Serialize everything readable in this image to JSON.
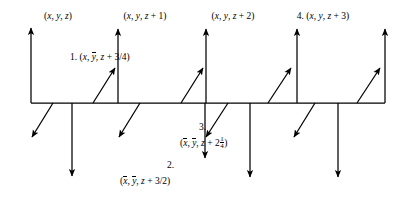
{
  "diagram": {
    "type": "symmetry-operator-diagram",
    "stroke_color": "#000000",
    "background_color": "#ffffff",
    "baseline_y": 103,
    "baseline_x_start": 31,
    "baseline_x_end": 385,
    "period_px": 88,
    "top_labels": [
      {
        "id": "pos-0",
        "prefix": "",
        "coords": "(x, y, z)",
        "x": 35,
        "parts": [
          "(",
          "x",
          ", ",
          "y",
          ", ",
          "z",
          ")"
        ]
      },
      {
        "id": "pos-1",
        "prefix": "",
        "coords": "(x, y, z + 1)",
        "x": 122,
        "parts": [
          "(",
          "x",
          ", ",
          "y",
          ", ",
          "z",
          " + 1)"
        ]
      },
      {
        "id": "pos-2",
        "prefix": "",
        "coords": "(x, y, z + 2)",
        "x": 210,
        "parts": [
          "(",
          "x",
          ", ",
          "y",
          ", ",
          "z",
          " + 2)"
        ]
      },
      {
        "id": "pos-3",
        "prefix": "4.",
        "coords": "(x, y, z + 3)",
        "x": 300,
        "parts": [
          "(",
          "x",
          ", ",
          "y",
          ", ",
          "z",
          " + 3)"
        ]
      }
    ],
    "op_labels": [
      {
        "id": "op-1",
        "number": "1.",
        "open": "(",
        "x_sym": "x",
        "sep1": ", ",
        "y_sym": "y",
        "y_bar": true,
        "sep2": ", ",
        "z_sym": "z",
        "plus": " + ",
        "fraction_num": "3",
        "fraction_den": "4",
        "close": ")",
        "text": "1. (x, ȳ, z + 3/4)"
      },
      {
        "id": "op-2",
        "number": "2.",
        "open": "(",
        "x_sym": "x",
        "x_bar": true,
        "sep1": ", ",
        "y_sym": "y",
        "y_bar": true,
        "sep2": ", ",
        "z_sym": "z",
        "plus": " + ",
        "fraction_num": "3",
        "fraction_den": "2",
        "close": ")",
        "text": "2. (x̄, ȳ, z + 3/2)"
      },
      {
        "id": "op-3",
        "number": "3.",
        "open": "(",
        "x_sym": "x",
        "x_bar": true,
        "sep1": ", ",
        "y_sym": "y",
        "y_bar": true,
        "sep2": ", ",
        "z_sym": "z",
        "plus": " + ",
        "whole": "2",
        "fraction_num": "1",
        "fraction_den": "4",
        "close": ")",
        "text": "3. (x̄, ȳ, z + 2¼)"
      },
      {
        "id": "op-4",
        "number": "4.",
        "text": "4. (x, y, z + 3)"
      }
    ],
    "arrows": {
      "up_vertical": [
        {
          "x": 31,
          "y0": 103,
          "y1": 28
        },
        {
          "x": 118,
          "y0": 103,
          "y1": 29
        },
        {
          "x": 206,
          "y0": 103,
          "y1": 29
        },
        {
          "x": 297,
          "y0": 103,
          "y1": 29
        },
        {
          "x": 385,
          "y0": 103,
          "y1": 29
        }
      ],
      "down_vertical": [
        {
          "x": 72,
          "y0": 103,
          "y1": 176
        },
        {
          "x": 205,
          "y0": 103,
          "y1": 158
        },
        {
          "x": 250,
          "y0": 103,
          "y1": 177
        },
        {
          "x": 338,
          "y0": 103,
          "y1": 177
        }
      ],
      "up_diagonal": [
        {
          "x0": 93,
          "y0": 103,
          "x1": 115,
          "y1": 68
        },
        {
          "x0": 181,
          "y0": 103,
          "x1": 203,
          "y1": 68
        },
        {
          "x0": 268,
          "y0": 103,
          "x1": 291,
          "y1": 68
        },
        {
          "x0": 357,
          "y0": 103,
          "x1": 380,
          "y1": 68
        }
      ],
      "down_diagonal": [
        {
          "x0": 53,
          "y0": 103,
          "x1": 32,
          "y1": 137
        },
        {
          "x0": 140,
          "y0": 103,
          "x1": 119,
          "y1": 137
        },
        {
          "x0": 228,
          "y0": 103,
          "x1": 206,
          "y1": 137
        },
        {
          "x0": 315,
          "y0": 103,
          "x1": 294,
          "y1": 137
        }
      ]
    }
  }
}
